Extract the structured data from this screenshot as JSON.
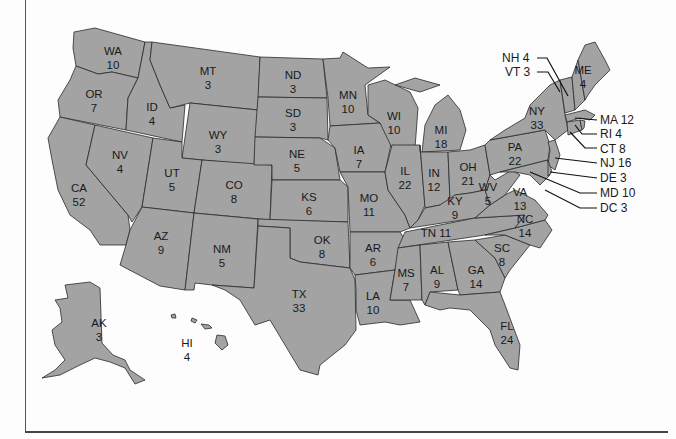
{
  "map": {
    "type": "US electoral votes by state",
    "colors": {
      "fill": "#a3a3a3",
      "border": "#2a2a2a",
      "background": "#fdfdfd"
    },
    "states": [
      {
        "abbr": "WA",
        "votes": "10"
      },
      {
        "abbr": "OR",
        "votes": "7"
      },
      {
        "abbr": "CA",
        "votes": "52"
      },
      {
        "abbr": "ID",
        "votes": "4"
      },
      {
        "abbr": "NV",
        "votes": "4"
      },
      {
        "abbr": "MT",
        "votes": "3"
      },
      {
        "abbr": "WY",
        "votes": "3"
      },
      {
        "abbr": "UT",
        "votes": "5"
      },
      {
        "abbr": "AZ",
        "votes": "9"
      },
      {
        "abbr": "CO",
        "votes": "8"
      },
      {
        "abbr": "NM",
        "votes": "5"
      },
      {
        "abbr": "ND",
        "votes": "3"
      },
      {
        "abbr": "SD",
        "votes": "3"
      },
      {
        "abbr": "NE",
        "votes": "5"
      },
      {
        "abbr": "KS",
        "votes": "6"
      },
      {
        "abbr": "OK",
        "votes": "8"
      },
      {
        "abbr": "TX",
        "votes": "33"
      },
      {
        "abbr": "MN",
        "votes": "10"
      },
      {
        "abbr": "IA",
        "votes": "7"
      },
      {
        "abbr": "MO",
        "votes": "11"
      },
      {
        "abbr": "AR",
        "votes": "6"
      },
      {
        "abbr": "LA",
        "votes": "10"
      },
      {
        "abbr": "WI",
        "votes": "10"
      },
      {
        "abbr": "IL",
        "votes": "22"
      },
      {
        "abbr": "MI",
        "votes": "18"
      },
      {
        "abbr": "IN",
        "votes": "12"
      },
      {
        "abbr": "OH",
        "votes": "21"
      },
      {
        "abbr": "KY",
        "votes": "9"
      },
      {
        "abbr": "TN",
        "votes": "11"
      },
      {
        "abbr": "MS",
        "votes": "7"
      },
      {
        "abbr": "AL",
        "votes": "9"
      },
      {
        "abbr": "GA",
        "votes": "14"
      },
      {
        "abbr": "FL",
        "votes": "24"
      },
      {
        "abbr": "SC",
        "votes": "8"
      },
      {
        "abbr": "NC",
        "votes": "14"
      },
      {
        "abbr": "VA",
        "votes": "13"
      },
      {
        "abbr": "WV",
        "votes": "5"
      },
      {
        "abbr": "PA",
        "votes": "22"
      },
      {
        "abbr": "NY",
        "votes": "33"
      },
      {
        "abbr": "ME",
        "votes": "4"
      },
      {
        "abbr": "AK",
        "votes": "3"
      },
      {
        "abbr": "HI",
        "votes": "4"
      }
    ],
    "callouts": [
      {
        "abbr": "NH",
        "votes": "4",
        "text": "NH 4"
      },
      {
        "abbr": "VT",
        "votes": "3",
        "text": "VT 3"
      },
      {
        "abbr": "MA",
        "votes": "12",
        "text": "MA 12"
      },
      {
        "abbr": "RI",
        "votes": "4",
        "text": "RI 4"
      },
      {
        "abbr": "CT",
        "votes": "8",
        "text": "CT 8"
      },
      {
        "abbr": "NJ",
        "votes": "16",
        "text": "NJ 16"
      },
      {
        "abbr": "DE",
        "votes": "3",
        "text": "DE 3"
      },
      {
        "abbr": "MD",
        "votes": "10",
        "text": "MD 10"
      },
      {
        "abbr": "DC",
        "votes": "3",
        "text": "DC 3"
      }
    ]
  }
}
